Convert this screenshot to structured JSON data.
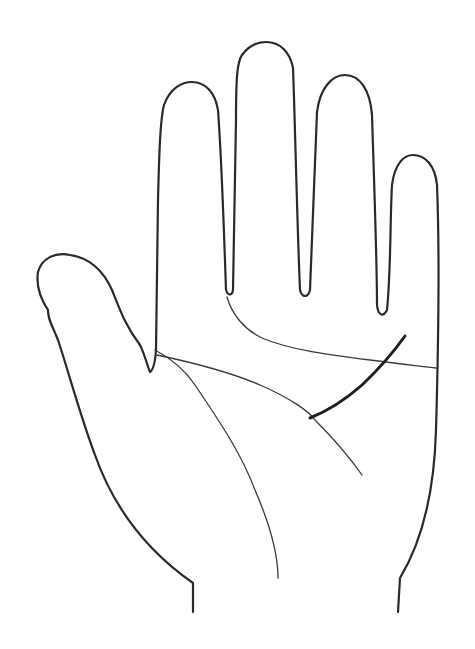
{
  "diagram": {
    "colors": {
      "background": "#ffffff",
      "outline": "#2a2a2a",
      "thin_line": "#3a3a3a",
      "highlighted_line": "#1e1e1e"
    },
    "parts": [
      {
        "id": "thumb",
        "label": "Thumb"
      },
      {
        "id": "index",
        "label": "Index finger"
      },
      {
        "id": "middle",
        "label": "Middle finger"
      },
      {
        "id": "ring",
        "label": "Ring finger"
      },
      {
        "id": "little",
        "label": "Little finger"
      },
      {
        "id": "wrist",
        "label": "Wrist"
      }
    ],
    "palm_lines": [
      {
        "id": "heart-line",
        "label": "Heart line",
        "style": "thin"
      },
      {
        "id": "head-line",
        "label": "Head line",
        "style": "thin"
      },
      {
        "id": "life-line",
        "label": "Life line",
        "style": "thin"
      },
      {
        "id": "highlighted-line",
        "label": "Highlighted line",
        "style": "bold"
      }
    ]
  }
}
